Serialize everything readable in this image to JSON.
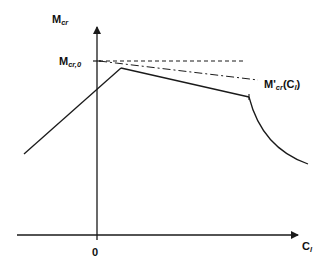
{
  "diagram": {
    "title": "",
    "colors": {
      "line": "#1a1a1a",
      "background": "#ffffff"
    },
    "y_axis": {
      "label_main": "M",
      "label_sub": "cr",
      "tick_label_main": "M",
      "tick_label_sub": "cr,0"
    },
    "x_axis": {
      "label_main": "C",
      "label_sub": "l",
      "origin_label": "0"
    },
    "curves": [
      {
        "name": "solid-rising-branch",
        "style": "solid",
        "description": "linear increase crossing y-axis up to peak"
      },
      {
        "name": "solid-falling-branch",
        "style": "solid",
        "description": "linear decrease after peak"
      },
      {
        "name": "solid-curved-drop",
        "style": "solid",
        "description": "concave drop after vertical tick"
      },
      {
        "name": "reference-horizontal",
        "style": "dashed",
        "description": "constant Mcr,0 level"
      },
      {
        "name": "modified-curve",
        "style": "dash-dot",
        "description": "M'cr(Cl)"
      }
    ],
    "annotation": {
      "prefix": "M'",
      "sub": "cr",
      "suffix_open": "(C",
      "suffix_sub": "l",
      "suffix_close": ")"
    }
  }
}
